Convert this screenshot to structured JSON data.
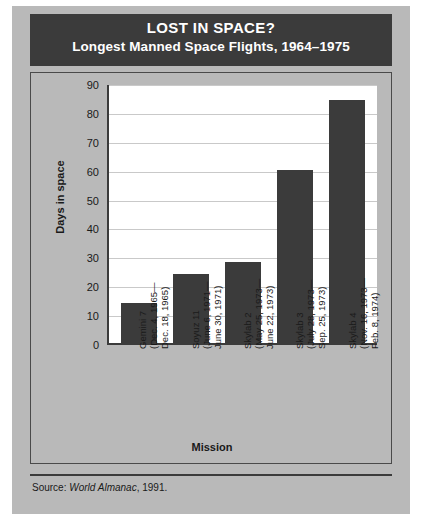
{
  "header": {
    "title": "LOST IN SPACE?",
    "subtitle": "Longest Manned Space Flights, 1964–1975"
  },
  "source": {
    "prefix": "Source: ",
    "publication": "World Almanac",
    "suffix": ", 1991."
  },
  "chart_data": {
    "type": "bar",
    "title": "LOST IN SPACE? Longest Manned Space Flights, 1964–1975",
    "xlabel": "Mission",
    "ylabel": "Days in space",
    "ylim": [
      0,
      90
    ],
    "ytick_step": 10,
    "yticks": [
      90,
      80,
      70,
      60,
      50,
      40,
      30,
      20,
      10,
      0
    ],
    "grid": true,
    "legend": "none",
    "bar_color": "#3b3b3b",
    "plot_background": "#ffffff",
    "categories": [
      "Gemini 7",
      "Soyuz 11",
      "Skylab 2",
      "Skylab 3",
      "Skylab 4"
    ],
    "category_dates": [
      [
        "(Dec. 4, 1965—",
        "Dec. 18, 1965)"
      ],
      [
        "(June 6, 1971—",
        "June 30, 1971)"
      ],
      [
        "(May 25, 1973—",
        "June 22, 1973)"
      ],
      [
        "(July 28, 1973—",
        "Sep. 25, 1973)"
      ],
      [
        "(Nov. 16, 1973—",
        "Feb. 8, 1974)"
      ]
    ],
    "values": [
      14,
      24,
      28,
      60,
      84
    ]
  }
}
